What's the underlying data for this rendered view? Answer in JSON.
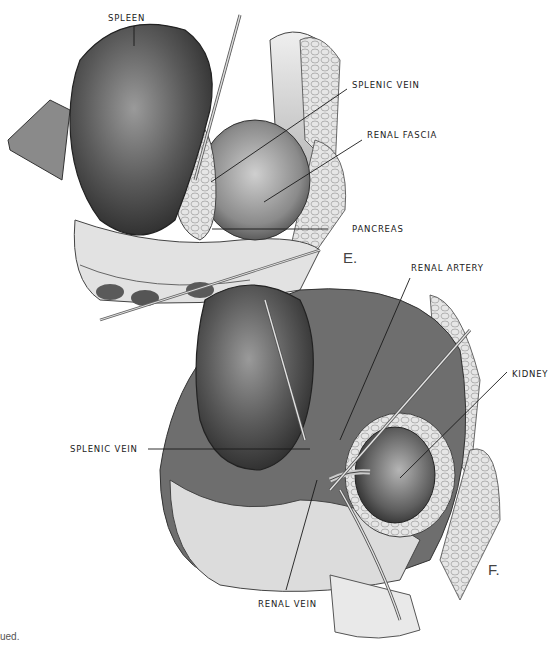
{
  "figure": {
    "panels": [
      {
        "id": "E",
        "letter": "E.",
        "labels": [
          {
            "text": "SPLEEN"
          },
          {
            "text": "SPLENIC VEIN"
          },
          {
            "text": "RENAL FASCIA"
          },
          {
            "text": "PANCREAS"
          }
        ]
      },
      {
        "id": "F",
        "letter": "F.",
        "labels": [
          {
            "text": "RENAL ARTERY"
          },
          {
            "text": "KIDNEY"
          },
          {
            "text": "SPLENIC VEIN"
          },
          {
            "text": "RENAL VEIN"
          }
        ]
      }
    ],
    "footer_fragment": "ued.",
    "colors": {
      "ink": "#1a1a1a",
      "organ_dark": "#3a3a3a",
      "organ_mid": "#7a7a7a",
      "tissue_light": "#d8d8d8",
      "background": "#ffffff"
    }
  }
}
